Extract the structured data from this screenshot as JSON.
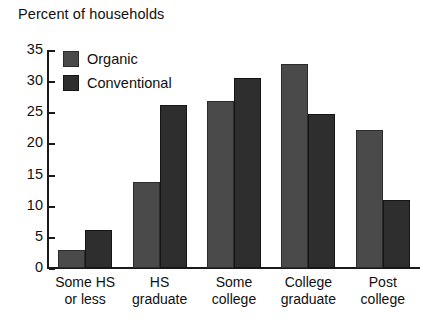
{
  "chart_data": {
    "type": "bar",
    "title": "Percent of households",
    "xlabel": "",
    "ylabel": "",
    "ylim": [
      0,
      35
    ],
    "yticks": [
      0,
      5,
      10,
      15,
      20,
      25,
      30,
      35
    ],
    "grid": false,
    "legend_position": "top-left-inside",
    "categories": [
      "Some HS or less",
      "HS graduate",
      "Some college",
      "College graduate",
      "Post college"
    ],
    "category_lines": [
      {
        "line1": "Some HS",
        "line2": "or less"
      },
      {
        "line1": "HS",
        "line2": "graduate"
      },
      {
        "line1": "Some",
        "line2": "college"
      },
      {
        "line1": "College",
        "line2": "graduate"
      },
      {
        "line1": "Post",
        "line2": "college"
      }
    ],
    "series": [
      {
        "name": "Organic",
        "color": "#4a4a4a",
        "values": [
          2.9,
          13.8,
          26.8,
          32.8,
          22.2
        ]
      },
      {
        "name": "Conventional",
        "color": "#2e2e2e",
        "values": [
          6.1,
          26.2,
          30.5,
          24.7,
          10.9
        ]
      }
    ]
  },
  "legend": {
    "items": [
      {
        "label": "Organic"
      },
      {
        "label": "Conventional"
      }
    ]
  },
  "axis": {
    "y_tick_labels": [
      "0",
      "5",
      "10",
      "15",
      "20",
      "25",
      "30",
      "35"
    ]
  },
  "colors": {
    "organic": "#4a4a4a",
    "conventional": "#2e2e2e",
    "axis": "#1a1a1a",
    "background": "#ffffff",
    "text": "#101010"
  }
}
